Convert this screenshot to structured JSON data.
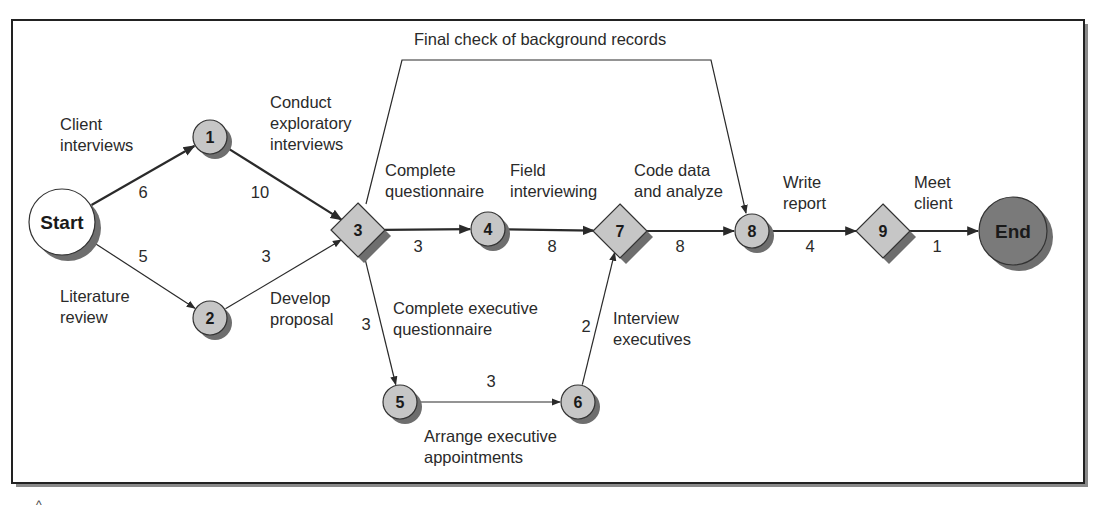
{
  "diagram": {
    "type": "network",
    "colors": {
      "frame": "#222222",
      "frame_shadow": "#8a8a8a",
      "node_fill": "#c6c6c6",
      "node_shadow": "#6e6e6e",
      "start_fill": "#ffffff",
      "end_fill": "#7a7a7a",
      "edge": "#2a2a2a"
    },
    "frame": {
      "x": 12,
      "y": 20,
      "w": 1072,
      "h": 463
    },
    "nodes": [
      {
        "id": "start",
        "label": "Start",
        "shape": "circle",
        "style": "start",
        "x": 62,
        "y": 222,
        "r": 33
      },
      {
        "id": "1",
        "label": "1",
        "shape": "circle",
        "style": "normal",
        "x": 210,
        "y": 137,
        "r": 17
      },
      {
        "id": "2",
        "label": "2",
        "shape": "circle",
        "style": "normal",
        "x": 210,
        "y": 318,
        "r": 17
      },
      {
        "id": "3",
        "label": "3",
        "shape": "diamond",
        "style": "normal",
        "x": 358,
        "y": 230,
        "r": 27
      },
      {
        "id": "4",
        "label": "4",
        "shape": "circle",
        "style": "normal",
        "x": 488,
        "y": 229,
        "r": 17
      },
      {
        "id": "5",
        "label": "5",
        "shape": "circle",
        "style": "normal",
        "x": 400,
        "y": 402,
        "r": 17
      },
      {
        "id": "6",
        "label": "6",
        "shape": "circle",
        "style": "normal",
        "x": 578,
        "y": 402,
        "r": 17
      },
      {
        "id": "7",
        "label": "7",
        "shape": "diamond",
        "style": "normal",
        "x": 620,
        "y": 231,
        "r": 27
      },
      {
        "id": "8",
        "label": "8",
        "shape": "circle",
        "style": "normal",
        "x": 752,
        "y": 231,
        "r": 17
      },
      {
        "id": "9",
        "label": "9",
        "shape": "diamond",
        "style": "normal",
        "x": 883,
        "y": 231,
        "r": 27
      },
      {
        "id": "end",
        "label": "End",
        "shape": "circle",
        "style": "end",
        "x": 1013,
        "y": 231,
        "r": 34
      }
    ],
    "edges": [
      {
        "from": "start",
        "to": "1",
        "duration": "6",
        "activity": [
          "Client",
          "interviews"
        ],
        "bold": true,
        "num_pos": [
          143,
          198
        ],
        "act_pos": [
          60,
          130
        ]
      },
      {
        "from": "start",
        "to": "2",
        "duration": "5",
        "activity": [
          "Literature",
          "review"
        ],
        "bold": false,
        "num_pos": [
          143,
          262
        ],
        "act_pos": [
          60,
          302
        ]
      },
      {
        "from": "1",
        "to": "3",
        "duration": "10",
        "activity": [
          "Conduct",
          "exploratory",
          "interviews"
        ],
        "bold": true,
        "num_pos": [
          260,
          198
        ],
        "act_pos": [
          270,
          108
        ]
      },
      {
        "from": "2",
        "to": "3",
        "duration": "3",
        "activity": [
          "Develop",
          "proposal"
        ],
        "bold": false,
        "num_pos": [
          266,
          262
        ],
        "act_pos": [
          270,
          304
        ]
      },
      {
        "from": "3",
        "to": "4",
        "duration": "3",
        "activity": [
          "Complete",
          "questionnaire"
        ],
        "bold": true,
        "num_pos": [
          418,
          252
        ],
        "act_pos": [
          385,
          176
        ]
      },
      {
        "from": "4",
        "to": "7",
        "duration": "8",
        "activity": [
          "Field",
          "interviewing"
        ],
        "bold": true,
        "num_pos": [
          552,
          252
        ],
        "act_pos": [
          510,
          176
        ]
      },
      {
        "from": "7",
        "to": "8",
        "duration": "8",
        "activity": [
          "Code data",
          "and analyze"
        ],
        "bold": true,
        "num_pos": [
          680,
          252
        ],
        "act_pos": [
          634,
          176
        ]
      },
      {
        "from": "8",
        "to": "9",
        "duration": "4",
        "activity": [
          "Write",
          "report"
        ],
        "bold": true,
        "num_pos": [
          810,
          252
        ],
        "act_pos": [
          783,
          188
        ]
      },
      {
        "from": "9",
        "to": "end",
        "duration": "1",
        "activity": [
          "Meet",
          "client"
        ],
        "bold": true,
        "num_pos": [
          937,
          252
        ],
        "act_pos": [
          914,
          188
        ]
      },
      {
        "from": "3",
        "to": "5",
        "duration": "3",
        "activity": [
          "Complete executive",
          "questionnaire"
        ],
        "bold": false,
        "num_pos": [
          366,
          330
        ],
        "act_pos": [
          393,
          314
        ]
      },
      {
        "from": "5",
        "to": "6",
        "duration": "3",
        "activity": [
          "Arrange executive",
          "appointments"
        ],
        "bold": false,
        "num_pos": [
          491,
          387
        ],
        "act_pos": [
          424,
          442
        ]
      },
      {
        "from": "6",
        "to": "7",
        "duration": "2",
        "activity": [
          "Interview",
          "executives"
        ],
        "bold": false,
        "num_pos": [
          586,
          332
        ],
        "act_pos": [
          613,
          324
        ]
      },
      {
        "from": "3",
        "to": "8",
        "duration": "",
        "activity": [
          "Final check of background records"
        ],
        "bold": false,
        "path": [
          [
            366,
            204
          ],
          [
            402,
            60
          ],
          [
            711,
            60
          ],
          [
            746,
            213
          ]
        ],
        "act_pos": [
          414,
          45
        ]
      }
    ]
  }
}
